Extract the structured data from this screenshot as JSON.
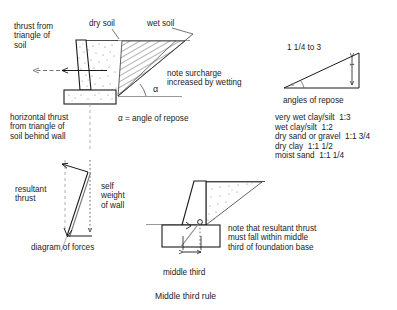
{
  "figure": {
    "caption": "Middle third rule",
    "units_note": "α = angle of repose"
  },
  "main_diagram": {
    "labels": {
      "thrust_from_triangle": "thrust from\ntriangle of\nsoil",
      "dry_soil": "dry soil",
      "wet_soil": "wet soil",
      "note_surcharge": "note surcharge\nincreased by wetting",
      "alpha_symbol": "α",
      "alpha_definition": "α = angle of repose",
      "horizontal_thrust": "horizontal thrust\nfrom triangle of\nsoil behind wall"
    }
  },
  "force_diagram": {
    "labels": {
      "resultant_thrust": "resultant\nthrust",
      "self_weight": "self\nweight\nof wall",
      "caption": "diagram of forces"
    }
  },
  "repose_diagram": {
    "labels": {
      "ratio": "1 1/4 to 3",
      "rise": "1",
      "angle_mark": "α",
      "caption": "angles of repose"
    },
    "table": {
      "rows": [
        "very wet clay/silt  1:3",
        "wet clay/silt  1:2",
        "dry sand or gravel  1:1 3/4",
        "dry clay  1:1 1/2",
        "moist sand  1:1 1/4"
      ]
    }
  },
  "middle_third_diagram": {
    "labels": {
      "note": "note that resultant thrust\nmust fall within middle\nthird of foundation base",
      "middle_third": "middle third",
      "caption": "Middle third rule"
    }
  },
  "colors": {
    "ink": "#1b1b1b",
    "line": "#2a2a2a",
    "hatch": "#555555",
    "ground": "#9a9a9a",
    "stipple": "#6b6b6b",
    "dash": "#777777"
  }
}
